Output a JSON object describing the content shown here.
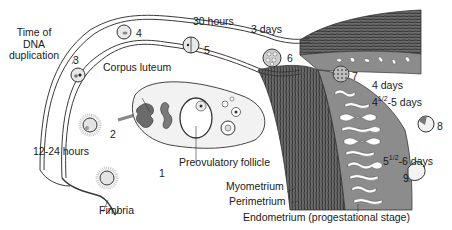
{
  "diagram": {
    "type": "anatomical",
    "labels": {
      "time_dna": "Time of DNA duplication",
      "time_dna_lines": [
        "Time of",
        "DNA",
        "duplication"
      ],
      "corpus_luteum": "Corpus luteum",
      "preovulatory_follicle": "Preovulatory follicle",
      "fimbria": "Fimbria",
      "h12_24": "12-24 hours",
      "h30": "30 hours",
      "d3": "3 days",
      "d4": "4 days",
      "d4_5_pre": "4",
      "d4_5_frac": "1/2",
      "d4_5_post": "-5 days",
      "d5_6_pre": "5",
      "d5_6_frac": "1/2",
      "d5_6_post": "-6 days",
      "myometrium": "Myometrium",
      "perimetrium": "Perimetrium",
      "endometrium": "Endometrium (progestational stage)"
    },
    "stages": [
      {
        "n": "1",
        "desc": "oocyte after ovulation"
      },
      {
        "n": "2",
        "desc": "fertilization"
      },
      {
        "n": "3",
        "desc": "pronuclei"
      },
      {
        "n": "4",
        "desc": "zygote"
      },
      {
        "n": "5",
        "desc": "2-cell stage"
      },
      {
        "n": "6",
        "desc": "8-cell stage"
      },
      {
        "n": "7",
        "desc": "morula"
      },
      {
        "n": "8",
        "desc": "early blastocyst"
      },
      {
        "n": "9",
        "desc": "implanting blastocyst"
      }
    ],
    "colors": {
      "line": "#3a3a3a",
      "tube_fill": "#9a9a9a",
      "myometrium": "#555555",
      "endometrium": "#8c8c8c",
      "corpus_luteum": "#6b6b6b",
      "background": "#ffffff"
    }
  }
}
